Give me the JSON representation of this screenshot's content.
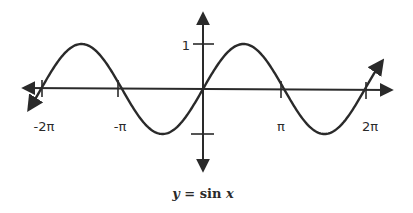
{
  "chart_data": {
    "type": "line",
    "title": "y = sin x",
    "function": "sin",
    "xlabel": "",
    "ylabel": "",
    "x_ticks": [
      {
        "value": -6.2832,
        "label": "-2π"
      },
      {
        "value": -3.1416,
        "label": "-π"
      },
      {
        "value": 3.1416,
        "label": "π"
      },
      {
        "value": 6.2832,
        "label": "2π"
      }
    ],
    "y_ticks": [
      {
        "value": 1,
        "label": "1"
      },
      {
        "value": -1,
        "label": ""
      }
    ],
    "xlim": [
      -6.6,
      6.9
    ],
    "ylim": [
      -1.3,
      1.3
    ],
    "grid": false,
    "series": [
      {
        "name": "sin x",
        "x": [
          -6.2832,
          -4.7124,
          -3.1416,
          -1.5708,
          0,
          1.5708,
          3.1416,
          4.7124,
          6.2832
        ],
        "y": [
          0,
          1,
          0,
          -1,
          0,
          1,
          0,
          -1,
          0
        ]
      }
    ],
    "curve_arrows": [
      "both-ends"
    ],
    "axis_arrows": true
  },
  "labels": {
    "x_neg2pi": "-2π",
    "x_negpi": "-π",
    "x_pi": "π",
    "x_2pi": "2π",
    "y_one": "1"
  },
  "caption": {
    "y": "y",
    "eq": " = sin ",
    "x": "x"
  },
  "colors": {
    "stroke": "#2a2a2a",
    "background": "#ffffff"
  }
}
